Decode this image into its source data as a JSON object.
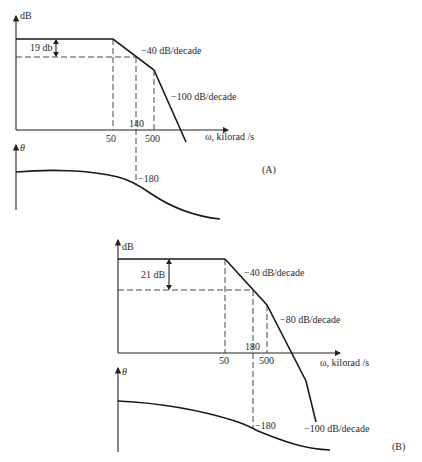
{
  "diagrams": [
    {
      "id": "A",
      "label": "(A)",
      "magnitude_axis_label": "dB",
      "phase_axis_label": "θ",
      "x_axis_label": "ω, kilorad /s",
      "gain_margin_label": "19 db",
      "slope_labels": [
        "−40 dB/decade",
        "−100 dB/decade"
      ],
      "x_ticks": [
        "50",
        "140",
        "500"
      ],
      "phase_marker": "−180"
    },
    {
      "id": "B",
      "label": "(B)",
      "magnitude_axis_label": "dB",
      "phase_axis_label": "θ",
      "x_axis_label": "ω, kilorad /s",
      "gain_margin_label": "21 dB",
      "slope_labels": [
        "−40 dB/decade",
        "−80 dB/decade",
        "−100 dB/decade"
      ],
      "x_ticks": [
        "50",
        "180",
        "500"
      ],
      "phase_marker": "−180"
    }
  ]
}
